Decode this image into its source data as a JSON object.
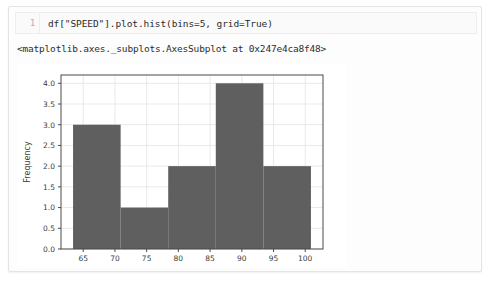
{
  "notebook": {
    "cell": {
      "line_number": "1",
      "code": "df[\"SPEED\"].plot.hist(bins=5, grid=True)"
    },
    "output_repr": "<matplotlib.axes._subplots.AxesSubplot at 0x247e4ca8f48>"
  },
  "colors": {
    "bar_fill": "#5f5f5f",
    "grid": "#e9e9e9",
    "axis": "#4a4a4a",
    "cell_background": "#fafafa",
    "page_background": "#ffffff"
  },
  "chart_data": {
    "type": "bar",
    "title": "",
    "xlabel": "",
    "ylabel": "Frequency",
    "grid": true,
    "legend": false,
    "bins": 5,
    "bin_edges": [
      63.4,
      70.9,
      78.4,
      85.9,
      93.4,
      100.9
    ],
    "categories": [
      "63.4-70.9",
      "70.9-78.4",
      "78.4-85.9",
      "85.9-93.4",
      "93.4-100.9"
    ],
    "values": [
      3,
      1,
      2,
      4,
      2
    ],
    "xlim": [
      61.5,
      102.8
    ],
    "ylim": [
      0.0,
      4.2
    ],
    "xticks": [
      65,
      70,
      75,
      80,
      85,
      90,
      95,
      100
    ],
    "xtick_labels": [
      "65",
      "70",
      "75",
      "80",
      "85",
      "90",
      "95",
      "100"
    ],
    "yticks": [
      0.0,
      0.5,
      1.0,
      1.5,
      2.0,
      2.5,
      3.0,
      3.5,
      4.0
    ],
    "ytick_labels": [
      "0.0",
      "0.5",
      "1.0",
      "1.5",
      "2.0",
      "2.5",
      "3.0",
      "3.5",
      "4.0"
    ]
  }
}
